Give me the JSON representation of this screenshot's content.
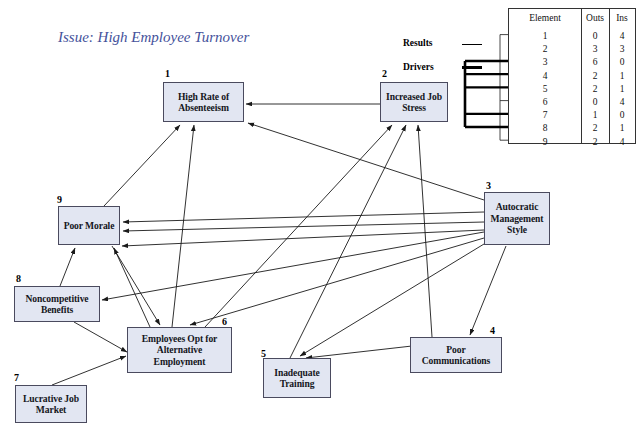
{
  "title": "Issue: High Employee Turnover",
  "legend": [
    {
      "label": "Results",
      "style": "thin-line"
    },
    {
      "label": "Drivers",
      "style": "thick-line"
    }
  ],
  "table": {
    "headers": [
      "Element",
      "Outs",
      "Ins"
    ],
    "rows": [
      {
        "element": "1",
        "outs": "0",
        "ins": "4",
        "kind": "result"
      },
      {
        "element": "2",
        "outs": "3",
        "ins": "3",
        "kind": "none"
      },
      {
        "element": "3",
        "outs": "6",
        "ins": "0",
        "kind": "driver"
      },
      {
        "element": "4",
        "outs": "2",
        "ins": "1",
        "kind": "driver"
      },
      {
        "element": "5",
        "outs": "2",
        "ins": "1",
        "kind": "driver"
      },
      {
        "element": "6",
        "outs": "0",
        "ins": "4",
        "kind": "result"
      },
      {
        "element": "7",
        "outs": "1",
        "ins": "0",
        "kind": "driver"
      },
      {
        "element": "8",
        "outs": "2",
        "ins": "1",
        "kind": "driver"
      },
      {
        "element": "9",
        "outs": "2",
        "ins": "4",
        "kind": "result"
      }
    ]
  },
  "nodes": [
    {
      "id": "1",
      "label": "High Rate of Absenteeism",
      "x": 163,
      "y": 82,
      "w": 81,
      "h": 40,
      "numx": 165,
      "numy": 68
    },
    {
      "id": "2",
      "label": "Increased Job Stress",
      "x": 380,
      "y": 82,
      "w": 68,
      "h": 40,
      "numx": 382,
      "numy": 68
    },
    {
      "id": "3",
      "label": "Autocratic Management Style",
      "x": 484,
      "y": 192,
      "w": 66,
      "h": 53,
      "numx": 486,
      "numy": 180
    },
    {
      "id": "4",
      "label": "Poor Communications",
      "x": 410,
      "y": 337,
      "w": 92,
      "h": 36,
      "numx": 490,
      "numy": 325
    },
    {
      "id": "5",
      "label": "Inadequate Training",
      "x": 263,
      "y": 358,
      "w": 68,
      "h": 40,
      "numx": 261,
      "numy": 348
    },
    {
      "id": "6",
      "label": "Employees Opt for Alternative Employment",
      "x": 127,
      "y": 327,
      "w": 105,
      "h": 46,
      "numx": 222,
      "numy": 316
    },
    {
      "id": "7",
      "label": "Lucrative Job Market",
      "x": 15,
      "y": 385,
      "w": 72,
      "h": 38,
      "numx": 14,
      "numy": 372
    },
    {
      "id": "8",
      "label": "Noncompetitive Benefits",
      "x": 14,
      "y": 286,
      "w": 86,
      "h": 36,
      "numx": 16,
      "numy": 273
    },
    {
      "id": "9",
      "label": "Poor Morale",
      "x": 58,
      "y": 206,
      "w": 62,
      "h": 39,
      "numx": 57,
      "numy": 194
    }
  ],
  "edges": [
    {
      "from": "2",
      "to": "1",
      "x1": 380,
      "y1": 104,
      "x2": 246,
      "y2": 104
    },
    {
      "from": "9",
      "to": "1",
      "x1": 104,
      "y1": 206,
      "x2": 180,
      "y2": 125
    },
    {
      "from": "6",
      "to": "1",
      "x1": 172,
      "y1": 327,
      "x2": 194,
      "y2": 125
    },
    {
      "from": "3",
      "to": "1",
      "x1": 484,
      "y1": 200,
      "x2": 248,
      "y2": 123
    },
    {
      "from": "6",
      "to": "2",
      "x1": 205,
      "y1": 327,
      "x2": 392,
      "y2": 125
    },
    {
      "from": "5",
      "to": "2",
      "x1": 290,
      "y1": 358,
      "x2": 406,
      "y2": 125
    },
    {
      "from": "4",
      "to": "2",
      "x1": 432,
      "y1": 337,
      "x2": 418,
      "y2": 125
    },
    {
      "from": "3",
      "to": "9",
      "x1": 484,
      "y1": 212,
      "x2": 123,
      "y2": 222
    },
    {
      "from": "3",
      "to": "9b",
      "x1": 484,
      "y1": 222,
      "x2": 123,
      "y2": 231
    },
    {
      "from": "8",
      "to": "9",
      "x1": 60,
      "y1": 286,
      "x2": 75,
      "y2": 248
    },
    {
      "from": "6",
      "to": "9",
      "x1": 150,
      "y1": 327,
      "x2": 114,
      "y2": 248
    },
    {
      "from": "3",
      "to": "9c",
      "x1": 484,
      "y1": 230,
      "x2": 122,
      "y2": 246
    },
    {
      "from": "9",
      "to": "6",
      "x1": 112,
      "y1": 246,
      "x2": 160,
      "y2": 325
    },
    {
      "from": "3",
      "to": "6",
      "x1": 484,
      "y1": 238,
      "x2": 190,
      "y2": 325
    },
    {
      "from": "8",
      "to": "6",
      "x1": 74,
      "y1": 322,
      "x2": 127,
      "y2": 352
    },
    {
      "from": "7",
      "to": "6",
      "x1": 52,
      "y1": 385,
      "x2": 126,
      "y2": 356
    },
    {
      "from": "3",
      "to": "8",
      "x1": 484,
      "y1": 232,
      "x2": 102,
      "y2": 300
    },
    {
      "from": "3",
      "to": "4",
      "x1": 506,
      "y1": 246,
      "x2": 470,
      "y2": 335
    },
    {
      "from": "4",
      "to": "5",
      "x1": 412,
      "y1": 346,
      "x2": 306,
      "y2": 358
    },
    {
      "from": "3",
      "to": "5",
      "x1": 484,
      "y1": 244,
      "x2": 300,
      "y2": 356
    }
  ],
  "colors": {
    "node_fill": "#e2e6f2",
    "node_border": "#4a4a5e",
    "title": "#44519b",
    "edge": "#1a1a1a"
  }
}
